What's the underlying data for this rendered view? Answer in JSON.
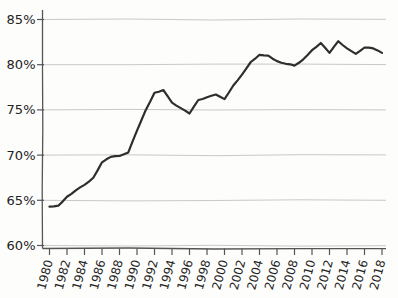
{
  "chart_data": {
    "type": "line",
    "title": "",
    "xlabel": "",
    "ylabel": "",
    "style": "hand-drawn",
    "grid": "horizontal",
    "legend": "none",
    "xlim": [
      1980,
      2018
    ],
    "ylim": [
      60,
      85
    ],
    "x": [
      1980,
      1981,
      1982,
      1983,
      1984,
      1985,
      1986,
      1987,
      1988,
      1989,
      1990,
      1991,
      1992,
      1993,
      1994,
      1995,
      1996,
      1997,
      1998,
      1999,
      2000,
      2001,
      2002,
      2003,
      2004,
      2005,
      2006,
      2007,
      2008,
      2009,
      2010,
      2011,
      2012,
      2013,
      2014,
      2015,
      2016,
      2017,
      2018
    ],
    "values": [
      64.3,
      64.4,
      65.4,
      66.1,
      66.7,
      67.5,
      69.2,
      69.8,
      69.9,
      70.3,
      72.7,
      75.0,
      76.9,
      77.2,
      75.8,
      75.2,
      74.6,
      76.1,
      76.4,
      76.7,
      76.2,
      77.7,
      78.9,
      80.3,
      81.1,
      81.0,
      80.4,
      80.1,
      79.9,
      80.6,
      81.6,
      82.4,
      81.3,
      82.6,
      81.8,
      81.2,
      81.9,
      81.8,
      81.3
    ],
    "yticks": [
      85,
      80,
      75,
      70,
      65,
      60
    ],
    "ytick_labels": [
      "85%",
      "80%",
      "75%",
      "70%",
      "65%",
      "60%"
    ],
    "xticks": [
      1980,
      1982,
      1984,
      1986,
      1988,
      1990,
      1992,
      1994,
      1996,
      1998,
      2000,
      2002,
      2004,
      2006,
      2008,
      2010,
      2012,
      2014,
      2016,
      2018
    ],
    "xtick_labels": [
      "1980",
      "1982",
      "1984",
      "1986",
      "1988",
      "1990",
      "1992",
      "1994",
      "1996",
      "1998",
      "2000",
      "2002",
      "2004",
      "2006",
      "2008",
      "2010",
      "2012",
      "2014",
      "2016",
      "2018"
    ],
    "colors": {
      "line": "#2e2e2e",
      "grid": "#c9c9c9",
      "axis": "#555555",
      "tick_label": "#222222",
      "background": "#fdfdfc"
    }
  }
}
